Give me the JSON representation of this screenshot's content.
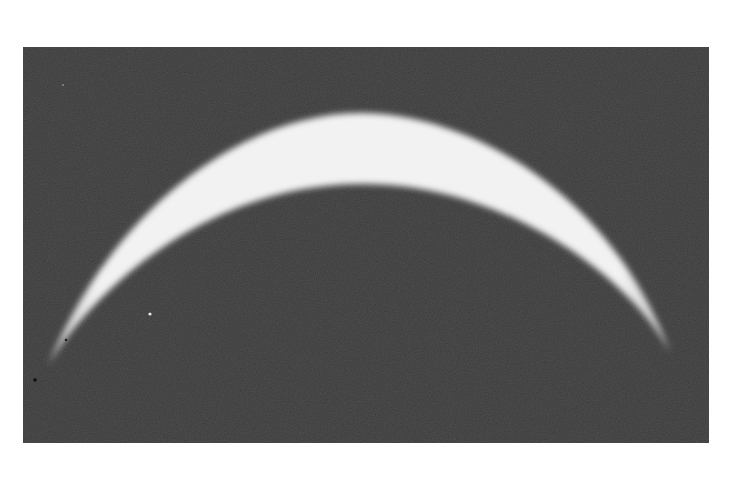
{
  "image": {
    "subject": "crescent",
    "description": "Grayscale photograph of a thin bright crescent arc against a dark background",
    "colors": {
      "page_background": "#ffffff",
      "sky_background": "#3a3a3a",
      "crescent_core": "#f4f4f4",
      "crescent_edge": "#bdbdbd"
    }
  }
}
